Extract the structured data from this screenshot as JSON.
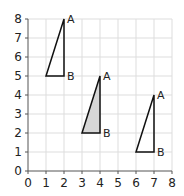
{
  "diagram": {
    "type": "coordinate-grid",
    "x_range": [
      0,
      8
    ],
    "y_range": [
      0,
      8
    ],
    "x_ticks": [
      "0",
      "1",
      "2",
      "3",
      "4",
      "5",
      "6",
      "7",
      "8"
    ],
    "y_ticks": [
      "0",
      "1",
      "2",
      "3",
      "4",
      "5",
      "6",
      "7",
      "8"
    ],
    "grid": true,
    "colors": {
      "grid": "#dddddd",
      "axis": "#555555",
      "shape_stroke": "#111111",
      "shaded_fill": "#d6d6d6"
    },
    "triangles": [
      {
        "name": "triangle-left",
        "vertices": [
          [
            1,
            5
          ],
          [
            2,
            5
          ],
          [
            2,
            8
          ]
        ],
        "shaded": false,
        "labels": [
          {
            "text": "A",
            "at": [
              2,
              8
            ]
          },
          {
            "text": "B",
            "at": [
              2,
              5
            ]
          }
        ]
      },
      {
        "name": "triangle-middle",
        "vertices": [
          [
            3,
            2
          ],
          [
            4,
            2
          ],
          [
            4,
            5
          ]
        ],
        "shaded": true,
        "labels": [
          {
            "text": "A",
            "at": [
              4,
              5
            ]
          },
          {
            "text": "B",
            "at": [
              4,
              2
            ]
          }
        ]
      },
      {
        "name": "triangle-right",
        "vertices": [
          [
            6,
            1
          ],
          [
            7,
            1
          ],
          [
            7,
            4
          ]
        ],
        "shaded": false,
        "labels": [
          {
            "text": "A",
            "at": [
              7,
              4
            ]
          },
          {
            "text": "B",
            "at": [
              7,
              1
            ]
          }
        ]
      }
    ]
  }
}
